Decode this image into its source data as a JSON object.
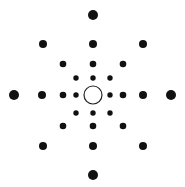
{
  "diagram": {
    "title": "",
    "center": {
      "x": 93,
      "y": 95,
      "r": 9,
      "stroke": "#222222",
      "fill": "#ffffff"
    },
    "dot_color": "#111111",
    "dots": [
      {
        "x": 93,
        "y": 15,
        "r": 5
      },
      {
        "x": 93,
        "y": 175,
        "r": 5
      },
      {
        "x": 14,
        "y": 95,
        "r": 5
      },
      {
        "x": 171,
        "y": 95,
        "r": 5
      },
      {
        "x": 43,
        "y": 44,
        "r": 4
      },
      {
        "x": 143,
        "y": 44,
        "r": 4
      },
      {
        "x": 43,
        "y": 146,
        "r": 4
      },
      {
        "x": 143,
        "y": 146,
        "r": 4
      },
      {
        "x": 93,
        "y": 44,
        "r": 4
      },
      {
        "x": 93,
        "y": 146,
        "r": 4
      },
      {
        "x": 42,
        "y": 95,
        "r": 4
      },
      {
        "x": 143,
        "y": 95,
        "r": 4
      },
      {
        "x": 63,
        "y": 64,
        "r": 3.3
      },
      {
        "x": 123,
        "y": 64,
        "r": 3.3
      },
      {
        "x": 63,
        "y": 126,
        "r": 3.3
      },
      {
        "x": 123,
        "y": 126,
        "r": 3.3
      },
      {
        "x": 93,
        "y": 64,
        "r": 3.3
      },
      {
        "x": 93,
        "y": 126,
        "r": 3.3
      },
      {
        "x": 63,
        "y": 95,
        "r": 3.3
      },
      {
        "x": 123,
        "y": 95,
        "r": 3.3
      },
      {
        "x": 76,
        "y": 78,
        "r": 2.7
      },
      {
        "x": 110,
        "y": 78,
        "r": 2.7
      },
      {
        "x": 76,
        "y": 113,
        "r": 2.7
      },
      {
        "x": 110,
        "y": 113,
        "r": 2.7
      },
      {
        "x": 93,
        "y": 78,
        "r": 2.7
      },
      {
        "x": 93,
        "y": 113,
        "r": 2.7
      },
      {
        "x": 76,
        "y": 95,
        "r": 2.7
      },
      {
        "x": 110,
        "y": 95,
        "r": 2.7
      }
    ]
  }
}
